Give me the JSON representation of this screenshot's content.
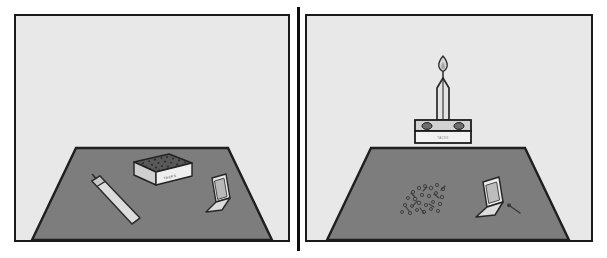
{
  "figure": {
    "panel_count": 2,
    "background_color": "#ffffff",
    "panel_fill": "#e8e8e8",
    "panel_border_color": "#1a1a1a",
    "divider_color": "#0d0d0d",
    "table_fill": "#7d7d7d",
    "table_outline": "#1f1f1f",
    "object_fill": "#d9d9d9",
    "object_outline": "#2a2a2a",
    "flame_color": "#cfcfcf"
  },
  "panels": [
    {
      "id": "before",
      "name": "before-panel",
      "objects": [
        {
          "name": "candle-unlit",
          "label": "",
          "state": "lying on table, unlit"
        },
        {
          "name": "tack-box",
          "label": "TACKS",
          "state": "full of tacks, closed on table"
        },
        {
          "name": "matchbook",
          "label": "",
          "state": "open, on table"
        }
      ]
    },
    {
      "id": "after",
      "name": "after-panel",
      "objects": [
        {
          "name": "candle-lit",
          "label": "",
          "state": "upright, lit, on box shelf"
        },
        {
          "name": "flame",
          "label": "",
          "state": "burning"
        },
        {
          "name": "tack-box-shelf",
          "label": "TACKS",
          "state": "emptied, tacked to wall as shelf"
        },
        {
          "name": "wall-tack-left",
          "label": "",
          "state": "pinning box to wall"
        },
        {
          "name": "wall-tack-right",
          "label": "",
          "state": "pinning box to wall"
        },
        {
          "name": "spilled-tacks",
          "label": "",
          "state": "scattered pile on table"
        },
        {
          "name": "matchbook",
          "label": "",
          "state": "open, on table"
        },
        {
          "name": "used-match",
          "label": "",
          "state": "spent, beside matchbook"
        }
      ]
    }
  ]
}
